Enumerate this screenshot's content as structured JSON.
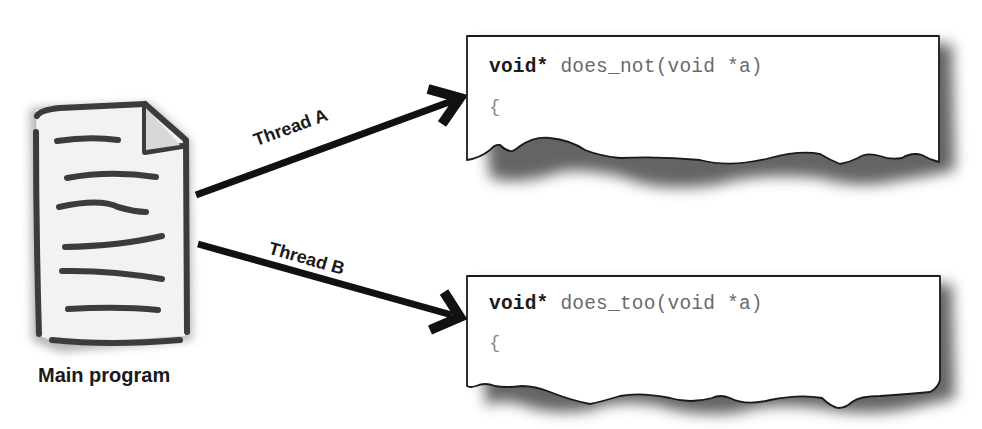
{
  "diagram": {
    "main_program": {
      "label": "Main program",
      "icon": "document-icon"
    },
    "threads": [
      {
        "label": "Thread A",
        "function": {
          "return_type": "void*",
          "signature": " does_not(void *a)",
          "body_open": "{"
        }
      },
      {
        "label": "Thread B",
        "function": {
          "return_type": "void*",
          "signature": " does_too(void *a)",
          "body_open": "{"
        }
      }
    ],
    "colors": {
      "ink": "#1a1a1a",
      "code_text": "#6a6a6a",
      "shadow": "#555555",
      "paper": "#ffffff"
    }
  }
}
